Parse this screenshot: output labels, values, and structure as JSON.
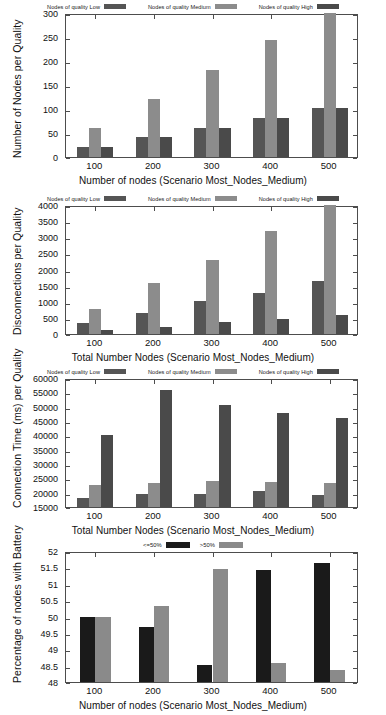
{
  "colors": {
    "low": "#555555",
    "medium": "#8c8c8c",
    "high": "#4a4a4a",
    "battery_le50": "#1a1a1a",
    "battery_gt50": "#8a8a8a",
    "axis": "#4d4d4d",
    "text": "#111111",
    "background": "#ffffff"
  },
  "legend_quality": [
    {
      "label": "Nodes of quality Low",
      "color_key": "low"
    },
    {
      "label": "Nodes of quality Medium",
      "color_key": "medium"
    },
    {
      "label": "Nodes of quality High",
      "color_key": "high"
    }
  ],
  "legend_battery": [
    {
      "label": "<=50%",
      "color_key": "battery_le50"
    },
    {
      "label": ">50%",
      "color_key": "battery_gt50"
    }
  ],
  "chart_data": [
    {
      "id": "nodes-per-quality",
      "type": "bar",
      "title": "",
      "xlabel": "Number of nodes (Scenario Most_Nodes_Medium)",
      "ylabel": "Number of Nodes per Quality",
      "categories": [
        "100",
        "200",
        "300",
        "400",
        "500"
      ],
      "ylim": [
        0,
        300
      ],
      "yticks": [
        0,
        50,
        100,
        150,
        200,
        250,
        300
      ],
      "ytick_labels": [
        "0",
        "50",
        "100",
        "150",
        "200",
        "250",
        "300"
      ],
      "grid": false,
      "legend_position": "top",
      "series": [
        {
          "name": "Nodes of quality Low",
          "color_key": "low",
          "values": [
            20,
            41,
            61,
            81,
            102
          ]
        },
        {
          "name": "Nodes of quality Medium",
          "color_key": "medium",
          "values": [
            60,
            121,
            182,
            243,
            310
          ]
        },
        {
          "name": "Nodes of quality High",
          "color_key": "high",
          "values": [
            20,
            41,
            61,
            81,
            102
          ]
        }
      ]
    },
    {
      "id": "disconnections-per-quality",
      "type": "bar",
      "title": "",
      "xlabel": "Total Number Nodes (Scenario Most_Nodes_Medium)",
      "ylabel": "Disconnections per Quality",
      "categories": [
        "100",
        "200",
        "300",
        "400",
        "500"
      ],
      "ylim": [
        0,
        4000
      ],
      "yticks": [
        0,
        500,
        1000,
        1500,
        2000,
        2500,
        3000,
        3500,
        4000
      ],
      "ytick_labels": [
        "0",
        "500",
        "1000",
        "1500",
        "2000",
        "2500",
        "3000",
        "3500",
        "4000"
      ],
      "grid": false,
      "legend_position": "top",
      "series": [
        {
          "name": "Nodes of quality Low",
          "color_key": "low",
          "values": [
            350,
            650,
            1010,
            1280,
            1650
          ]
        },
        {
          "name": "Nodes of quality Medium",
          "color_key": "medium",
          "values": [
            780,
            1590,
            2310,
            3180,
            4100
          ]
        },
        {
          "name": "Nodes of quality High",
          "color_key": "high",
          "values": [
            140,
            220,
            360,
            460,
            580
          ]
        }
      ]
    },
    {
      "id": "connection-time-per-quality",
      "type": "bar",
      "title": "",
      "xlabel": "Total Number Nodes (Scenario Most_Nodes_Medium)",
      "ylabel": "Connection Time (ms) per Quality",
      "categories": [
        "100",
        "200",
        "300",
        "400",
        "500"
      ],
      "ylim": [
        15000,
        60000
      ],
      "yticks": [
        15000,
        20000,
        25000,
        30000,
        35000,
        40000,
        45000,
        50000,
        55000,
        60000
      ],
      "ytick_labels": [
        "15000",
        "20000",
        "25000",
        "30000",
        "35000",
        "40000",
        "45000",
        "50000",
        "55000",
        "60000"
      ],
      "grid": false,
      "legend_position": "top",
      "series": [
        {
          "name": "Nodes of quality Low",
          "color_key": "low",
          "values": [
            18300,
            19400,
            19400,
            20600,
            19200
          ]
        },
        {
          "name": "Nodes of quality Medium",
          "color_key": "medium",
          "values": [
            22800,
            23300,
            24000,
            23600,
            23400
          ]
        },
        {
          "name": "Nodes of quality High",
          "color_key": "high",
          "values": [
            40000,
            55900,
            50700,
            47800,
            46200
          ]
        }
      ]
    },
    {
      "id": "percentage-nodes-with-battery",
      "type": "bar",
      "title": "",
      "xlabel": "Number of nodes (Scenario Most_Nodes_Medium)",
      "ylabel": "Percentage of nodes with Battery",
      "categories": [
        "100",
        "200",
        "300",
        "400",
        "500"
      ],
      "ylim": [
        48,
        52
      ],
      "yticks": [
        48,
        48.5,
        49,
        49.5,
        50,
        50.5,
        51,
        51.5,
        52
      ],
      "ytick_labels": [
        "48",
        "48.5",
        "49",
        "49.5",
        "50",
        "50.5",
        "51",
        "51.5",
        "52"
      ],
      "grid": false,
      "legend_position": "top",
      "series": [
        {
          "name": "<=50%",
          "color_key": "battery_le50",
          "values": [
            50.0,
            49.68,
            48.53,
            51.41,
            51.63
          ]
        },
        {
          "name": ">50%",
          "color_key": "battery_gt50",
          "values": [
            50.0,
            50.31,
            51.46,
            48.58,
            48.37
          ]
        }
      ]
    }
  ]
}
